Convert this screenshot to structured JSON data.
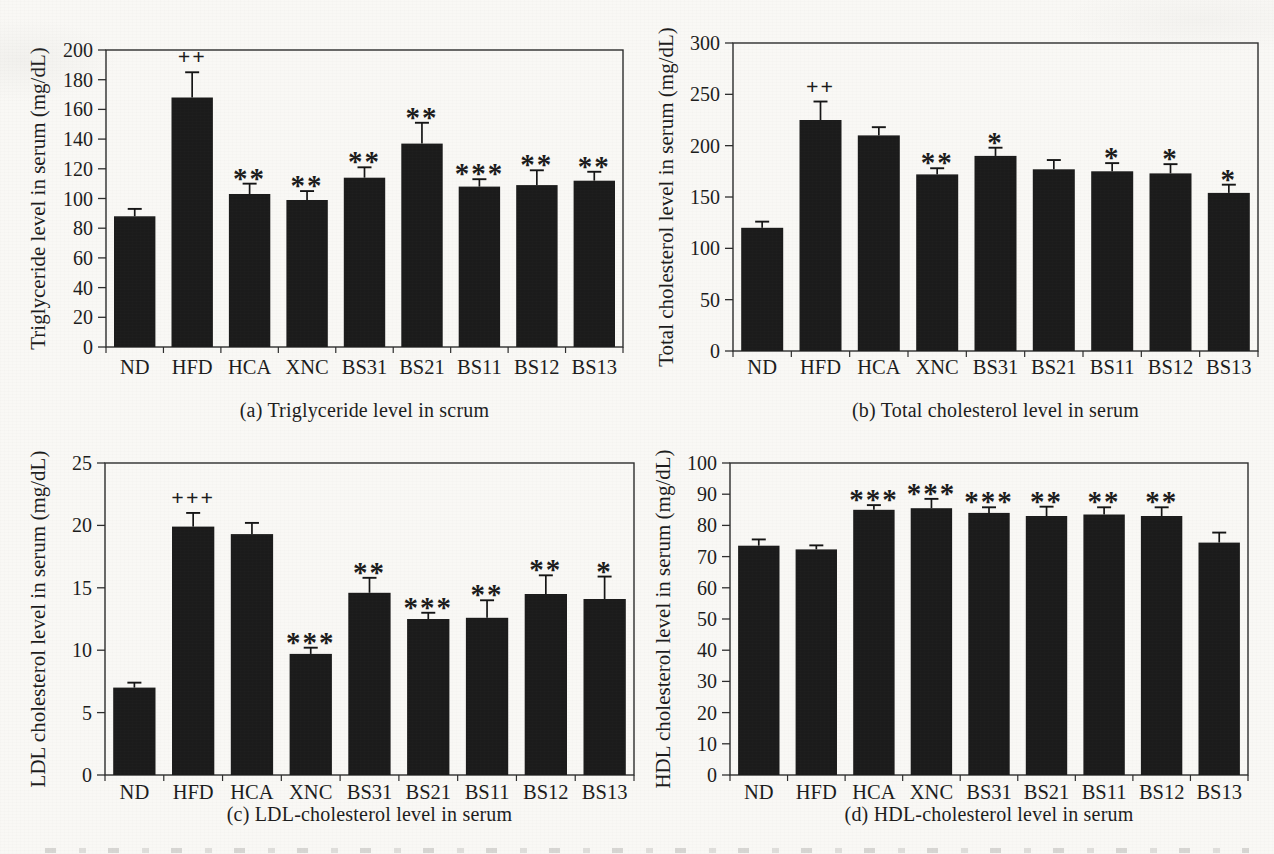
{
  "colors": {
    "bar": "#1b1b1b",
    "axis": "#2d2d2d",
    "text": "#1c1c1c",
    "paper": "#f9f8f5"
  },
  "categories": [
    "ND",
    "HFD",
    "HCA",
    "XNC",
    "BS31",
    "BS21",
    "BS11",
    "BS12",
    "BS13"
  ],
  "chart_data": [
    {
      "type": "bar",
      "panel": "a",
      "caption": "(a) Triglyceride level in scrum",
      "ylabel": "Triglyceride level in serum (mg/dL)",
      "ylim": [
        0,
        200
      ],
      "ytick_step": 20,
      "grid": false,
      "legend": "none",
      "categories": [
        "ND",
        "HFD",
        "HCA",
        "XNC",
        "BS31",
        "BS21",
        "BS11",
        "BS12",
        "BS13"
      ],
      "values": [
        88,
        168,
        103,
        99,
        114,
        137,
        108,
        109,
        112
      ],
      "errors": [
        5,
        17,
        7,
        6,
        7,
        14,
        5,
        10,
        6
      ],
      "sig_markers": [
        "",
        "++",
        "**",
        "**",
        "**",
        "**",
        "***",
        "**",
        "**"
      ]
    },
    {
      "type": "bar",
      "panel": "b",
      "caption": "(b) Total cholesterol level in serum",
      "ylabel": "Total cholesterol level in serum (mg/dL)",
      "ylim": [
        0,
        300
      ],
      "ytick_step": 50,
      "grid": false,
      "legend": "none",
      "categories": [
        "ND",
        "HFD",
        "HCA",
        "XNC",
        "BS31",
        "BS21",
        "BS11",
        "BS12",
        "BS13"
      ],
      "values": [
        120,
        225,
        210,
        172,
        190,
        177,
        175,
        173,
        154
      ],
      "errors": [
        6,
        18,
        8,
        6,
        8,
        9,
        8,
        9,
        8
      ],
      "sig_markers": [
        "",
        "++",
        "",
        "**",
        "*",
        "",
        "*",
        "*",
        "*"
      ]
    },
    {
      "type": "bar",
      "panel": "c",
      "caption": "(c) LDL-cholesterol level in serum",
      "ylabel": "LDL cholesterol level in serum (mg/dL)",
      "ylim": [
        0,
        25
      ],
      "ytick_step": 5,
      "grid": false,
      "legend": "none",
      "categories": [
        "ND",
        "HFD",
        "HCA",
        "XNC",
        "BS31",
        "BS21",
        "BS11",
        "BS12",
        "BS13"
      ],
      "values": [
        7.0,
        19.9,
        19.3,
        9.7,
        14.6,
        12.5,
        12.6,
        14.5,
        14.1
      ],
      "errors": [
        0.4,
        1.1,
        0.9,
        0.5,
        1.2,
        0.5,
        1.4,
        1.5,
        1.8
      ],
      "sig_markers": [
        "",
        "+++",
        "",
        "***",
        "**",
        "***",
        "**",
        "**",
        "*"
      ]
    },
    {
      "type": "bar",
      "panel": "d",
      "caption": "(d) HDL-cholesterol level in serum",
      "ylabel": "HDL cholesterol level in serum (mg/dL)",
      "ylim": [
        0,
        100
      ],
      "ytick_step": 10,
      "grid": false,
      "legend": "none",
      "categories": [
        "ND",
        "HFD",
        "HCA",
        "XNC",
        "BS31",
        "BS21",
        "BS11",
        "BS12",
        "BS13"
      ],
      "values": [
        73.5,
        72.3,
        85.0,
        85.5,
        84.0,
        83.0,
        83.5,
        83.0,
        74.5
      ],
      "errors": [
        2.0,
        1.3,
        1.5,
        3.0,
        1.8,
        3.0,
        2.3,
        2.8,
        3.2
      ],
      "sig_markers": [
        "",
        "",
        "***",
        "***",
        "***",
        "**",
        "**",
        "**",
        ""
      ]
    }
  ]
}
